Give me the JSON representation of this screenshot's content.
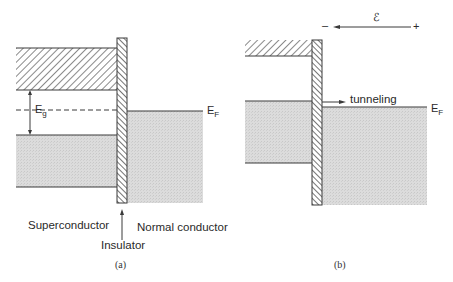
{
  "panels": [
    {
      "id": "a",
      "caption": "(a)",
      "labels": {
        "energy_gap_main": "E",
        "energy_gap_sub": "g",
        "fermi_main": "E",
        "fermi_sub": "F",
        "superconductor": "Superconductor",
        "insulator": "Insulator",
        "normal_conductor": "Normal conductor"
      }
    },
    {
      "id": "b",
      "caption": "(b)",
      "labels": {
        "field_symbol": "ℰ",
        "field_minus": "–",
        "field_plus": "+",
        "tunneling": "tunneling",
        "fermi_main": "E",
        "fermi_sub": "F"
      }
    }
  ],
  "colors": {
    "line": "#3a3a3a",
    "shade": "#d9d9d9",
    "hatch": "#555555",
    "background": "#ffffff"
  }
}
